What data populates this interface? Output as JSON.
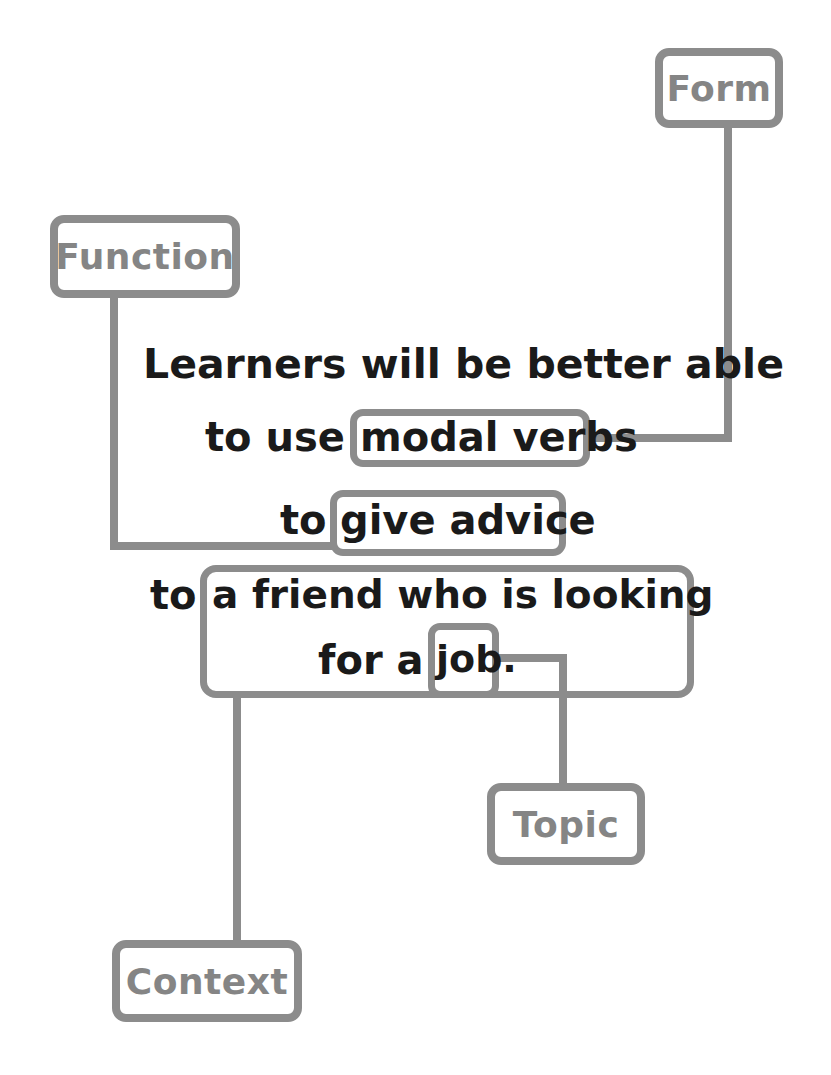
{
  "diagram": {
    "labels": {
      "form": "Form",
      "function": "Function",
      "topic": "Topic",
      "context": "Context"
    },
    "sentence": {
      "line1": "Learners will be better able",
      "line2_prefix": "to use",
      "line2_highlight": "modal verbs",
      "line3_prefix": "to",
      "line3_highlight": "give advice",
      "line4_prefix": "to",
      "line4_highlight": "a friend who is looking",
      "line5_prefix": "for a",
      "line5_highlight": "job."
    },
    "mappings": [
      {
        "label": "Form",
        "target": "modal verbs"
      },
      {
        "label": "Function",
        "target": "give advice"
      },
      {
        "label": "Topic",
        "target": "job."
      },
      {
        "label": "Context",
        "target": "a friend who is looking for a job."
      }
    ],
    "colors": {
      "box_border": "#8c8c8c",
      "label_text": "#858585",
      "sentence_text": "#1a1a1a",
      "background": "#ffffff"
    }
  }
}
